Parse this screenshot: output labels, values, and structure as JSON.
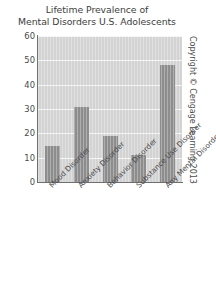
{
  "chart_data": {
    "type": "bar",
    "title": "Lifetime Prevalence of Mental Disorders U.S. Adolescents",
    "title_lines": [
      "Lifetime Prevalence of",
      "Mental Disorders U.S. Adolescents"
    ],
    "categories": [
      "Mood Disorder",
      "Anxiety Disorder",
      "Behavior Disorder",
      "Substance Use Disorder",
      "Any Mental Disorder"
    ],
    "values": [
      15,
      31,
      19,
      11,
      48
    ],
    "xlabel": "",
    "ylabel": "",
    "ylim": [
      0,
      60
    ],
    "yticks": [
      60,
      50,
      40,
      30,
      20,
      10,
      0
    ],
    "ytick_labels": [
      "60",
      "50",
      "40",
      "30",
      "20",
      "10",
      "0"
    ],
    "grid": true,
    "legend": false,
    "colors": {
      "bar": "#8d8d8d",
      "plot_background": "#d3d3d3",
      "gridline": "#f4f4f4",
      "axis": "#6f6f6f",
      "text": "#4a4a4a"
    }
  },
  "credit": {
    "text": "Copyright © Cengage Learning 2013"
  }
}
